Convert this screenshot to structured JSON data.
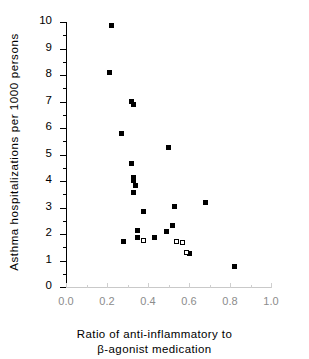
{
  "chart_data": {
    "type": "scatter",
    "title": "",
    "xlabel": "Ratio of anti-inflammatory to β-agonist medication",
    "xlabel_line1": "Ratio of anti-inflammatory to",
    "xlabel_line2": "β-agonist medication",
    "ylabel": "Asthma hospitalizations per 1000 persons",
    "xlim": [
      0.0,
      1.0
    ],
    "ylim": [
      0,
      10
    ],
    "xticks": [
      0.0,
      0.2,
      0.4,
      0.6,
      0.8,
      1.0
    ],
    "xticklabels": [
      "0.0",
      "0.2",
      "0.4",
      "0.6",
      "0.8",
      "1.0"
    ],
    "yticks": [
      0,
      1,
      2,
      3,
      4,
      5,
      6,
      7,
      8,
      9,
      10
    ],
    "yticklabels": [
      "0",
      "1",
      "2",
      "3",
      "4",
      "5",
      "6",
      "7",
      "8",
      "9",
      "10"
    ],
    "x_minor_ticks": [
      0.1,
      0.3,
      0.5,
      0.7,
      0.9
    ],
    "y_minor_ticks": [
      0.5,
      1.5,
      2.5,
      3.5,
      4.5,
      5.5,
      6.5,
      7.5,
      8.5,
      9.5
    ],
    "grid": false,
    "legend": null,
    "marker_color": "#000000",
    "series": [
      {
        "name": "filled",
        "marker": "filled-square",
        "points": [
          {
            "x": 0.22,
            "y": 9.85
          },
          {
            "x": 0.21,
            "y": 8.1
          },
          {
            "x": 0.32,
            "y": 7.0
          },
          {
            "x": 0.33,
            "y": 6.9
          },
          {
            "x": 0.27,
            "y": 5.8
          },
          {
            "x": 0.5,
            "y": 5.28
          },
          {
            "x": 0.32,
            "y": 4.65
          },
          {
            "x": 0.33,
            "y": 4.15
          },
          {
            "x": 0.33,
            "y": 4.02
          },
          {
            "x": 0.34,
            "y": 3.83
          },
          {
            "x": 0.33,
            "y": 3.55
          },
          {
            "x": 0.68,
            "y": 3.17
          },
          {
            "x": 0.53,
            "y": 3.02
          },
          {
            "x": 0.38,
            "y": 2.85
          },
          {
            "x": 0.52,
            "y": 2.33
          },
          {
            "x": 0.35,
            "y": 2.15
          },
          {
            "x": 0.49,
            "y": 2.1
          },
          {
            "x": 0.35,
            "y": 1.87
          },
          {
            "x": 0.43,
            "y": 1.88
          },
          {
            "x": 0.28,
            "y": 1.7
          },
          {
            "x": 0.6,
            "y": 1.28
          },
          {
            "x": 0.82,
            "y": 0.78
          }
        ]
      },
      {
        "name": "open",
        "marker": "open-square",
        "points": [
          {
            "x": 0.38,
            "y": 1.75
          },
          {
            "x": 0.54,
            "y": 1.7
          },
          {
            "x": 0.57,
            "y": 1.68
          },
          {
            "x": 0.59,
            "y": 1.3
          }
        ]
      }
    ]
  },
  "axis": {
    "y_title": "Asthma hospitalizations per 1000 persons",
    "x_title_line1": "Ratio of anti-inflammatory to",
    "x_title_line2": "β-agonist medication"
  }
}
